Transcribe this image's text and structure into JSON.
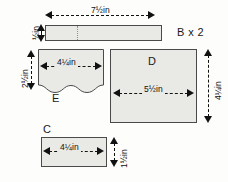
{
  "diagram": {
    "style": {
      "piece_fill": "#e9e9e6",
      "piece_stroke": "#4a4a4a",
      "ink": "#111111",
      "background": "#fdfdfc",
      "guide": "#8d8d8d"
    },
    "pieces": [
      {
        "id": "B",
        "label": "B x 2",
        "shape": "rectangle",
        "dimensions": {
          "width": "7½in",
          "height": "½in"
        }
      },
      {
        "id": "E",
        "label": "E",
        "shape": "wavy-bottom-rectangle",
        "dimensions": {
          "width": "4¼in",
          "height": "2½in"
        }
      },
      {
        "id": "D",
        "label": "D",
        "shape": "rectangle",
        "dimensions": {
          "width": "5½in",
          "height": "4¼in"
        }
      },
      {
        "id": "C",
        "label": "C",
        "shape": "rectangle",
        "dimensions": {
          "width": "4¼in",
          "height": "1½in"
        }
      }
    ],
    "labels": {
      "b_multiplier": "B x 2",
      "b_width": "7½in",
      "b_height": "½in",
      "e_name": "E",
      "e_width": "4¼in",
      "e_height": "2½in",
      "d_name": "D",
      "d_width": "5½in",
      "d_height": "4¼in",
      "c_name": "C",
      "c_width": "4¼in",
      "c_height": "1½in"
    }
  }
}
